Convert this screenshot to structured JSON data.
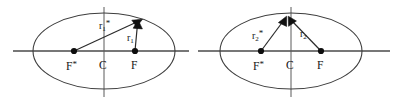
{
  "figure": {
    "type": "geometry-diagram",
    "background_color": "#ffffff",
    "line_color": "#3d3d3d",
    "axis_color": "#4a4a4a",
    "marker_color": "#0d0d0d"
  },
  "diagrams": [
    {
      "id": "left-ellipse",
      "labels": {
        "focus_left": "F",
        "focus_left_star": "*",
        "center": "C",
        "focus_right": "F",
        "radius_star": "r",
        "radius_star_sub": "1",
        "radius_star_mark": "*",
        "radius": "r",
        "radius_sub": "1"
      }
    },
    {
      "id": "right-ellipse",
      "labels": {
        "focus_left": "F",
        "focus_left_star": "*",
        "center": "C",
        "focus_right": "F",
        "radius_star": "r",
        "radius_star_sub": "2",
        "radius_star_mark": "*",
        "radius": "r",
        "radius_sub": "2"
      }
    }
  ]
}
